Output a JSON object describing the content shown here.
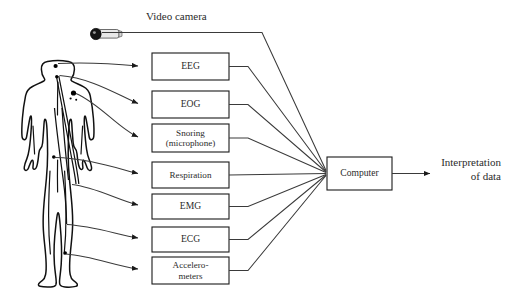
{
  "figure": {
    "title_label": "Video camera",
    "output_line1": "Interpretation",
    "output_line2": "of data",
    "computer_label": "Computer",
    "subject_label": "human-body-silhouette",
    "camera_label": "video-camera-device",
    "background_color": "#ffffff",
    "line_color": "#3a3a3a",
    "box_border_color": "#1a1a1a",
    "text_color": "#2b2b2b"
  },
  "sensors": [
    {
      "id": "eeg",
      "label": "EEG",
      "line2": "",
      "x": 152,
      "y": 53,
      "w": 77,
      "h": 27
    },
    {
      "id": "eog",
      "label": "EOG",
      "line2": "",
      "x": 152,
      "y": 91,
      "w": 77,
      "h": 27
    },
    {
      "id": "snoring",
      "label": "Snoring",
      "line2": "(microphone)",
      "x": 152,
      "y": 124,
      "w": 77,
      "h": 28
    },
    {
      "id": "respiration",
      "label": "Respiration",
      "line2": "",
      "x": 152,
      "y": 162,
      "w": 77,
      "h": 26
    },
    {
      "id": "emg",
      "label": "EMG",
      "line2": "",
      "x": 152,
      "y": 194,
      "w": 77,
      "h": 25
    },
    {
      "id": "ecg",
      "label": "ECG",
      "line2": "",
      "x": 152,
      "y": 227,
      "w": 77,
      "h": 25
    },
    {
      "id": "accelerometers",
      "label": "Accelero-",
      "line2": "meters",
      "x": 152,
      "y": 257,
      "w": 77,
      "h": 27
    }
  ],
  "computer": {
    "label": "Computer",
    "x": 327,
    "y": 157,
    "w": 65,
    "h": 33
  },
  "output": {
    "line1": "Interpretation",
    "line2": "of data",
    "arrow_x1": 392,
    "arrow_x2": 432,
    "arrow_y": 173
  },
  "camera": {
    "name": "video-camera",
    "cx": 96,
    "cy": 35,
    "line_to_x": 262,
    "label": "Video camera",
    "label_x": 146,
    "label_y": 20
  }
}
